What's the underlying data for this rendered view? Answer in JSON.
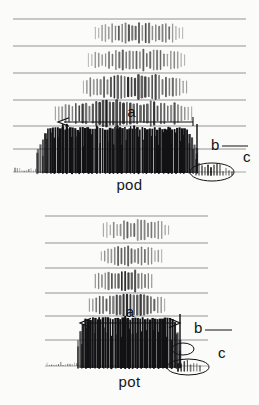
{
  "figure": {
    "background_color": "#fbfbfa",
    "ink_color": "#121214",
    "gridline_color": "#6e6e72"
  },
  "panels": [
    {
      "id": "pod",
      "word_label": "pod",
      "annotations": [
        {
          "key": "a",
          "label": "a",
          "meaning": "vowel-duration-arrow",
          "arrow_type": "single-headed-left",
          "x_start": 193,
          "x_end": 58,
          "y": 122
        },
        {
          "key": "b",
          "label": "b",
          "meaning": "voicing-offset-marker",
          "x": 211,
          "y": 150
        },
        {
          "key": "c",
          "label": "c",
          "meaning": "release-burst-circle",
          "x": 243,
          "y": 162,
          "ellipse_cx": 212,
          "ellipse_cy": 172,
          "ellipse_rx": 22,
          "ellipse_ry": 9
        }
      ],
      "gridlines_y": [
        19,
        46,
        73,
        100,
        126,
        149,
        172
      ],
      "grid_x_start": 13,
      "grid_x_end": 246
    },
    {
      "id": "pot",
      "word_label": "pot",
      "annotations": [
        {
          "key": "a",
          "label": "a",
          "meaning": "vowel-duration-arrow",
          "arrow_type": "double-headed",
          "x_start": 80,
          "x_end": 180,
          "y": 120
        },
        {
          "key": "b",
          "label": "b",
          "meaning": "aspiration-marker",
          "x": 194,
          "y": 130,
          "ellipse_cx": 183,
          "ellipse_cy": 146,
          "ellipse_rx": 11,
          "ellipse_ry": 6
        },
        {
          "key": "c",
          "label": "c",
          "meaning": "release-burst-circle",
          "x": 218,
          "y": 155,
          "ellipse_cx": 188,
          "ellipse_cy": 164,
          "ellipse_rx": 21,
          "ellipse_ry": 8
        }
      ],
      "gridlines_y": [
        13,
        40,
        65,
        90,
        113,
        137,
        163
      ],
      "grid_x_start": 45,
      "grid_x_end": 208
    }
  ],
  "chart_data": {
    "type": "heatmap",
    "xlabel": "Time",
    "ylabel": "Frequency",
    "grid": true,
    "legend": "none",
    "series": [
      {
        "name": "pod",
        "word": "pod",
        "voicing_bar": {
          "x_start": 38,
          "x_end": 197,
          "y_top": 128,
          "y_bottom": 173,
          "density": "high"
        },
        "formant_bands": [
          {
            "name": "F4",
            "y_top": 20,
            "y_bottom": 46,
            "x_start": 92,
            "x_end": 186,
            "strength": 0.55
          },
          {
            "name": "F3",
            "y_top": 47,
            "y_bottom": 73,
            "x_start": 85,
            "x_end": 188,
            "strength": 0.5
          },
          {
            "name": "F2",
            "y_top": 74,
            "y_bottom": 100,
            "x_start": 80,
            "x_end": 190,
            "strength": 0.7
          },
          {
            "name": "F1",
            "y_top": 101,
            "y_bottom": 126,
            "x_start": 52,
            "x_end": 195,
            "strength": 0.8
          }
        ],
        "burst": {
          "x_start": 196,
          "x_end": 232,
          "y_top": 160,
          "y_bottom": 175
        },
        "annotation_labels": [
          "a",
          "b",
          "c"
        ]
      },
      {
        "name": "pot",
        "word": "pot",
        "voicing_bar": {
          "x_start": 78,
          "x_end": 180,
          "y_top": 115,
          "y_bottom": 165,
          "density": "high"
        },
        "formant_bands": [
          {
            "name": "F4",
            "y_top": 14,
            "y_bottom": 40,
            "x_start": 100,
            "x_end": 172,
            "strength": 0.45
          },
          {
            "name": "F3",
            "y_top": 41,
            "y_bottom": 65,
            "x_start": 98,
            "x_end": 165,
            "strength": 0.5
          },
          {
            "name": "F2",
            "y_top": 66,
            "y_bottom": 90,
            "x_start": 92,
            "x_end": 155,
            "strength": 0.65
          },
          {
            "name": "F1",
            "y_top": 91,
            "y_bottom": 113,
            "x_start": 86,
            "x_end": 168,
            "strength": 0.7
          }
        ],
        "burst": {
          "x_start": 178,
          "x_end": 200,
          "y_top": 155,
          "y_bottom": 168
        },
        "annotation_labels": [
          "a",
          "b",
          "c"
        ]
      }
    ]
  }
}
